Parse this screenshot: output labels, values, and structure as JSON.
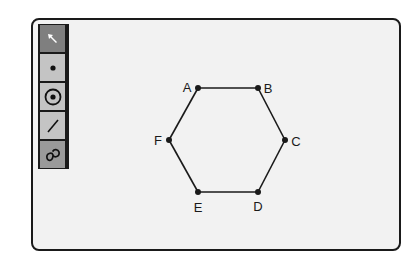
{
  "toolbar": {
    "tools": [
      {
        "name": "select",
        "icon": "arrow-pointer-icon",
        "selected": true
      },
      {
        "name": "point",
        "icon": "point-icon",
        "selected": false
      },
      {
        "name": "circle",
        "icon": "circle-icon",
        "selected": false
      },
      {
        "name": "line",
        "icon": "line-icon",
        "selected": false
      },
      {
        "name": "curve",
        "icon": "curve-icon",
        "selected": false
      }
    ]
  },
  "diagram": {
    "shape": "regular hexagon",
    "vertices": [
      {
        "label": "A",
        "x": 198,
        "y": 88,
        "label_x": 187,
        "label_y": 87
      },
      {
        "label": "B",
        "x": 258,
        "y": 88,
        "label_x": 268,
        "label_y": 88
      },
      {
        "label": "C",
        "x": 285,
        "y": 140,
        "label_x": 296,
        "label_y": 141
      },
      {
        "label": "D",
        "x": 258,
        "y": 192,
        "label_x": 258,
        "label_y": 206
      },
      {
        "label": "E",
        "x": 198,
        "y": 192,
        "label_x": 198,
        "label_y": 207
      },
      {
        "label": "F",
        "x": 169,
        "y": 140,
        "label_x": 158,
        "label_y": 140
      }
    ],
    "edges": [
      [
        "A",
        "B"
      ],
      [
        "B",
        "C"
      ],
      [
        "C",
        "D"
      ],
      [
        "D",
        "E"
      ],
      [
        "E",
        "F"
      ],
      [
        "F",
        "A"
      ]
    ]
  },
  "colors": {
    "stroke": "#1a1a1a",
    "canvas_bg": "#f2f2f2",
    "tool_bg": "#c4c4c4",
    "tool_selected_bg": "#7f7f7f"
  }
}
